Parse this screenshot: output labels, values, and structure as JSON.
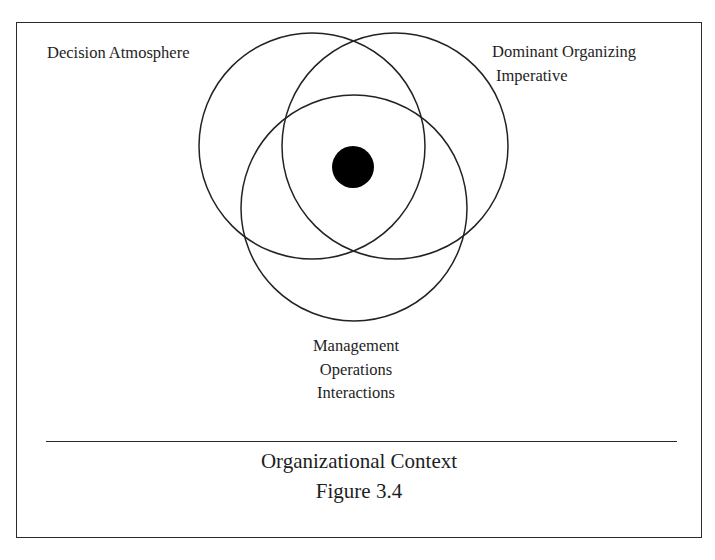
{
  "diagram": {
    "type": "venn",
    "circles": [
      {
        "id": "decision-atmosphere",
        "label": "Decision Atmosphere",
        "cx": 312,
        "cy": 146,
        "r": 113
      },
      {
        "id": "dominant-organizing-imperative",
        "label": "Dominant Organizing Imperative",
        "cx": 395,
        "cy": 146,
        "r": 113
      },
      {
        "id": "management-operations-interactions",
        "label": "Management Operations Interactions",
        "cx": 354,
        "cy": 208,
        "r": 113
      }
    ],
    "center_dot": {
      "cx": 353,
      "cy": 167,
      "r": 21,
      "color": "#000000"
    },
    "stroke_color": "#222222",
    "labels": {
      "decision": "Decision Atmosphere",
      "dominant_line1": "Dominant Organizing",
      "dominant_line2": "Imperative",
      "management_line1": "Management",
      "management_line2": "Operations",
      "management_line3": "Interactions"
    },
    "caption": {
      "title": "Organizational Context",
      "figure": "Figure 3.4"
    }
  }
}
